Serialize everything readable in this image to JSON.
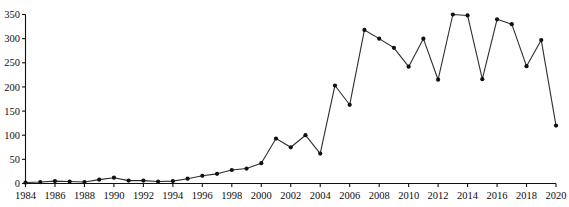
{
  "chart_data": {
    "type": "line",
    "title": "",
    "subtitle": "",
    "xlabel": "",
    "ylabel": "",
    "xlim": [
      1984,
      2020
    ],
    "ylim": [
      0,
      350
    ],
    "grid": false,
    "legend": false,
    "legend_position": "none",
    "marker": "filled-circle",
    "line_color": "#2e2e2e",
    "marker_color": "#101010",
    "axis_color": "#111111",
    "background_color": "#ffffff",
    "ytick_labels": [
      "0",
      "50",
      "100",
      "150",
      "200",
      "250",
      "300",
      "350"
    ],
    "ytick_values": [
      0,
      50,
      100,
      150,
      200,
      250,
      300,
      350
    ],
    "xtick_labels": [
      "1984",
      "1986",
      "1988",
      "1990",
      "1992",
      "1994",
      "1996",
      "1998",
      "2000",
      "2002",
      "2004",
      "2006",
      "2008",
      "2010",
      "2012",
      "2014",
      "2016",
      "2018",
      "2020"
    ],
    "xtick_values": [
      1984,
      1986,
      1988,
      1990,
      1992,
      1994,
      1996,
      1998,
      2000,
      2002,
      2004,
      2006,
      2008,
      2010,
      2012,
      2014,
      2016,
      2018,
      2020
    ],
    "x": [
      1984,
      1985,
      1986,
      1987,
      1988,
      1989,
      1990,
      1991,
      1992,
      1993,
      1994,
      1995,
      1996,
      1997,
      1998,
      1999,
      2000,
      2001,
      2002,
      2003,
      2004,
      2005,
      2006,
      2007,
      2008,
      2009,
      2010,
      2011,
      2012,
      2013,
      2014,
      2015,
      2016,
      2017,
      2018,
      2019,
      2020
    ],
    "values": [
      2,
      3,
      5,
      4,
      3,
      8,
      12,
      6,
      6,
      4,
      5,
      10,
      16,
      20,
      28,
      31,
      42,
      93,
      75,
      100,
      62,
      203,
      163,
      318,
      300,
      281,
      242,
      300,
      215,
      350,
      348,
      216,
      340,
      330,
      243,
      297,
      120
    ],
    "series": [
      {
        "name": "series-1",
        "values": [
          2,
          3,
          5,
          4,
          3,
          8,
          12,
          6,
          6,
          4,
          5,
          10,
          16,
          20,
          28,
          31,
          42,
          93,
          75,
          100,
          62,
          203,
          163,
          318,
          300,
          281,
          242,
          300,
          215,
          350,
          348,
          216,
          340,
          330,
          243,
          297,
          120
        ]
      }
    ],
    "annotations": []
  }
}
